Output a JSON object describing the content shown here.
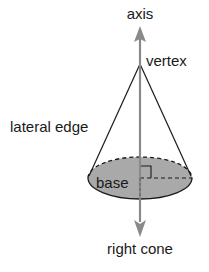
{
  "diagram": {
    "title": "right cone",
    "labels": {
      "axis": "axis",
      "vertex": "vertex",
      "lateral_edge": "lateral edge",
      "base": "base",
      "caption": "right cone"
    },
    "colors": {
      "lines": "#1a1a1a",
      "axis": "#8a8a8a",
      "base_fill": "#a9a9a9",
      "text": "#1a1a1a"
    },
    "geometry": {
      "vertex": [
        140,
        64
      ],
      "base_center": [
        140,
        178
      ],
      "base_rx": 52,
      "base_ry": 21
    }
  }
}
